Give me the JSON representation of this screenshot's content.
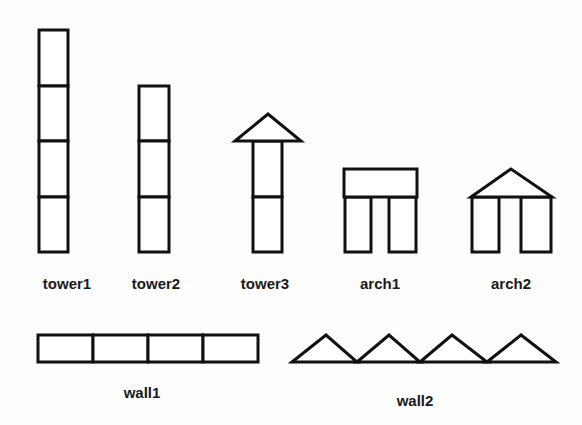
{
  "diagram": {
    "structures": [
      {
        "id": "tower1",
        "label": "tower1",
        "components": [
          "block",
          "block",
          "block",
          "block"
        ],
        "label_pos": [
          67,
          284
        ]
      },
      {
        "id": "tower2",
        "label": "tower2",
        "components": [
          "block",
          "block",
          "block"
        ],
        "label_pos": [
          156,
          284
        ]
      },
      {
        "id": "tower3",
        "label": "tower3",
        "components": [
          "block",
          "block",
          "triangle"
        ],
        "label_pos": [
          266,
          284
        ]
      },
      {
        "id": "arch1",
        "label": "arch1",
        "components": [
          "block",
          "block",
          "lintel"
        ],
        "label_pos": [
          380,
          284
        ]
      },
      {
        "id": "arch2",
        "label": "arch2",
        "components": [
          "block",
          "block",
          "triangle"
        ],
        "label_pos": [
          511,
          284
        ]
      },
      {
        "id": "wall1",
        "label": "wall1",
        "components": [
          "block",
          "block",
          "block",
          "block"
        ],
        "label_pos": [
          142,
          393
        ]
      },
      {
        "id": "wall2",
        "label": "wall2",
        "components": [
          "triangle",
          "triangle",
          "triangle",
          "triangle"
        ],
        "label_pos": [
          415,
          401
        ]
      }
    ],
    "colors": {
      "stroke": "#111111",
      "fill": "#ffffff",
      "text": "#1a1a1a"
    }
  }
}
